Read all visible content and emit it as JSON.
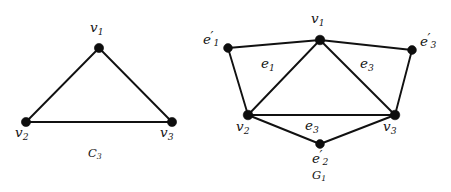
{
  "figure": {
    "background_color": "#ffffff",
    "ink_color": "#111111"
  },
  "graphs": [
    {
      "id": "left-graph",
      "caption": "C",
      "caption_sub": "3",
      "caption_full": "C3",
      "vertices": [
        {
          "id": "v1",
          "label": "v",
          "sub": "1",
          "prime": false,
          "x": 99,
          "y": 48,
          "label_x": 90,
          "label_y": 21
        },
        {
          "id": "v2",
          "label": "v",
          "sub": "2",
          "prime": false,
          "x": 26,
          "y": 122,
          "label_x": 15,
          "label_y": 126
        },
        {
          "id": "v3",
          "label": "v",
          "sub": "3",
          "prime": false,
          "x": 172,
          "y": 122,
          "label_x": 160,
          "label_y": 126
        }
      ],
      "edges": [
        {
          "from": "v1",
          "to": "v2",
          "label": null
        },
        {
          "from": "v1",
          "to": "v3",
          "label": null
        },
        {
          "from": "v2",
          "to": "v3",
          "label": null
        }
      ],
      "caption_x": 88,
      "caption_y": 148
    },
    {
      "id": "right-graph",
      "caption": "G",
      "caption_sub": "1",
      "caption_full": "G1",
      "vertices": [
        {
          "id": "v1",
          "label": "v",
          "sub": "1",
          "prime": false,
          "x": 320,
          "y": 40,
          "label_x": 311,
          "label_y": 12
        },
        {
          "id": "v2",
          "label": "v",
          "sub": "2",
          "prime": false,
          "x": 248,
          "y": 115,
          "label_x": 236,
          "label_y": 120
        },
        {
          "id": "v3",
          "label": "v",
          "sub": "3",
          "prime": false,
          "x": 395,
          "y": 115,
          "label_x": 383,
          "label_y": 120
        },
        {
          "id": "e1p",
          "label": "e",
          "sub": "1",
          "prime": true,
          "x": 228,
          "y": 48,
          "label_x": 203,
          "label_y": 31
        },
        {
          "id": "e3p",
          "label": "e",
          "sub": "3",
          "prime": true,
          "x": 412,
          "y": 50,
          "label_x": 420,
          "label_y": 33
        },
        {
          "id": "e2p",
          "label": "e",
          "sub": "2",
          "prime": true,
          "x": 320,
          "y": 144,
          "label_x": 312,
          "label_y": 150
        }
      ],
      "edges": [
        {
          "from": "v1",
          "to": "e1p",
          "label": null
        },
        {
          "from": "v1",
          "to": "e3p",
          "label": null
        },
        {
          "from": "v1",
          "to": "v2",
          "label": "e",
          "label_sub": "1",
          "label_x": 261,
          "label_y": 57
        },
        {
          "from": "v1",
          "to": "v3",
          "label": "e",
          "label_sub": "3",
          "label_x": 360,
          "label_y": 57
        },
        {
          "from": "e1p",
          "to": "v2",
          "label": null
        },
        {
          "from": "e3p",
          "to": "v3",
          "label": null
        },
        {
          "from": "v2",
          "to": "v3",
          "label": null
        },
        {
          "from": "v2",
          "to": "e2p",
          "label": "e",
          "label_sub": "3",
          "label_x": 305,
          "label_y": 119
        },
        {
          "from": "e2p",
          "to": "v3",
          "label": null
        }
      ],
      "caption_x": 312,
      "caption_y": 170
    }
  ],
  "labels": {
    "left": {
      "v1": "v1",
      "v2": "v2",
      "v3": "v3",
      "caption": "C3"
    },
    "right": {
      "v1": "v1",
      "v2": "v2",
      "v3": "v3",
      "e1_prime": "e1'",
      "e2_prime": "e2'",
      "e3_prime": "e3'",
      "edge_e1": "e1",
      "edge_e3_right": "e3",
      "edge_e3_bottom": "e3",
      "caption": "G1"
    }
  }
}
